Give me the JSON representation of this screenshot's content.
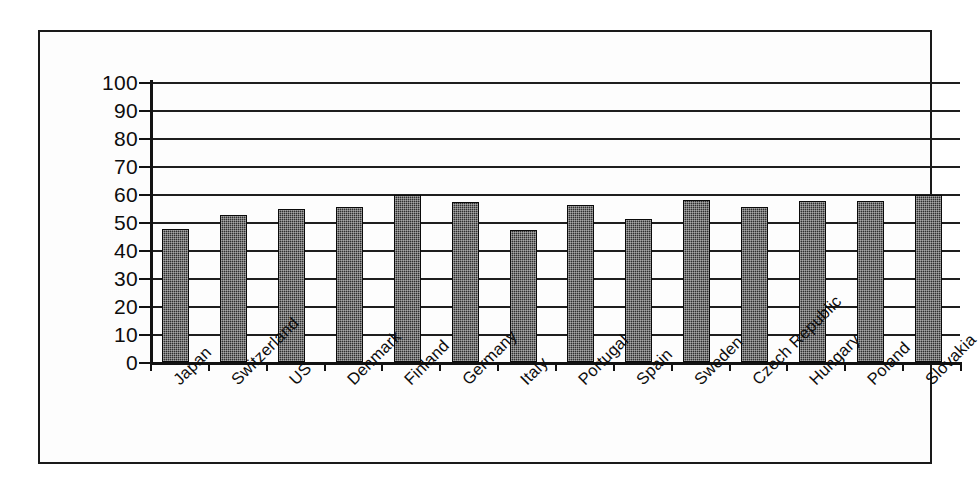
{
  "chart_data": {
    "type": "bar",
    "title": "",
    "subtitle": "",
    "xlabel": "",
    "ylabel": "",
    "ylim": [
      0,
      100
    ],
    "yticks": [
      0,
      10,
      20,
      30,
      40,
      50,
      60,
      70,
      80,
      90,
      100
    ],
    "grid": true,
    "legend": false,
    "legend_position": "none",
    "orientation": "vertical",
    "bar_fill": "#2f2f2f",
    "bar_pattern": "dotted-checker",
    "bar_edge_color": "#0a0a0a",
    "gridline_color": "#1e1e1e",
    "background_color": "#fdfdfd",
    "frame_color": "#1a1a1a",
    "categories": [
      "Japan",
      "Switzerland",
      "US",
      "Denmark",
      "Finland",
      "Germany",
      "Italy",
      "Portugal",
      "Spain",
      "Sweden",
      "Czech Republic",
      "Hungary",
      "Poland",
      "Slovakia"
    ],
    "values": [
      47.5,
      52.5,
      54.5,
      55.5,
      59.5,
      57,
      47,
      56,
      51,
      58,
      55.5,
      57.5,
      57.5,
      59.5
    ]
  }
}
